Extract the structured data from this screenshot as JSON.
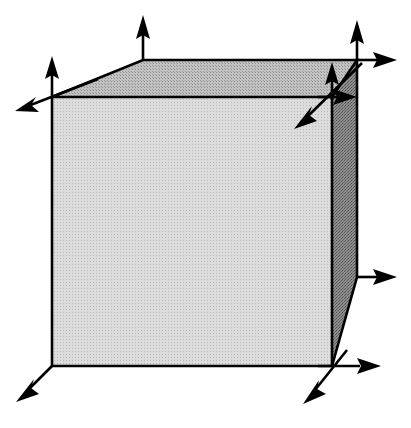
{
  "figure": {
    "type": "line-diagram",
    "canvas": {
      "width": 411,
      "height": 428,
      "background": "#ffffff"
    },
    "colors": {
      "stroke": "#000000",
      "front_face_fill": "#cfcfcf",
      "top_face_fill": "#b3b3b3",
      "right_face_fill": "#7e7e7e",
      "background": "#ffffff"
    },
    "stroke_width": 2.6,
    "cube": {
      "name": "cube",
      "vertices": {
        "front_top_left": [
          52,
          97
        ],
        "front_top_right": [
          332,
          97
        ],
        "front_bottom_left": [
          52,
          366
        ],
        "front_bottom_right": [
          332,
          366
        ],
        "back_top_left": [
          143,
          60
        ],
        "back_top_right": [
          357,
          60
        ],
        "back_bottom_right": [
          357,
          277
        ]
      },
      "faces": [
        {
          "name": "front-face",
          "points": "52,97 332,97 332,366 52,366",
          "fill_key": "front_face_fill"
        },
        {
          "name": "top-face",
          "points": "52,97 143,60 357,60 332,97",
          "fill_key": "top_face_fill"
        },
        {
          "name": "right-face",
          "points": "332,97 357,60 357,277 332,366",
          "fill_key": "right_face_fill"
        }
      ]
    },
    "arrows": [
      {
        "name": "arrow-up-front-top-left",
        "label": "z-axis at front-top-left corner",
        "from": [
          52,
          97
        ],
        "to": [
          52,
          58
        ],
        "head": "end",
        "direction": "up"
      },
      {
        "name": "arrow-diagonal-front-top-left",
        "label": "depth axis at front-top-left corner",
        "from": [
          95,
          80
        ],
        "to": [
          18,
          110
        ],
        "head": "end",
        "direction": "down-left"
      },
      {
        "name": "arrow-up-back-top-left",
        "label": "z-axis at back-top-left corner",
        "from": [
          143,
          60
        ],
        "to": [
          143,
          17
        ],
        "head": "end",
        "direction": "up"
      },
      {
        "name": "arrow-up-back-top-right",
        "label": "z-axis at back-top-right corner",
        "from": [
          357,
          60
        ],
        "to": [
          357,
          22
        ],
        "head": "end",
        "direction": "up"
      },
      {
        "name": "arrow-right-back-top-right",
        "label": "x-axis at back-top-right corner",
        "from": [
          357,
          60
        ],
        "to": [
          396,
          60
        ],
        "head": "end",
        "direction": "right"
      },
      {
        "name": "arrow-up-front-top-right",
        "label": "z-axis at front-top-right corner",
        "from": [
          332,
          97
        ],
        "to": [
          332,
          63
        ],
        "head": "end",
        "direction": "up"
      },
      {
        "name": "arrow-right-front-top-right",
        "label": "x-axis at front-top-right corner",
        "from": [
          332,
          97
        ],
        "to": [
          356,
          97
        ],
        "head": "end",
        "direction": "right"
      },
      {
        "name": "arrow-diagonal-front-top-right",
        "label": "depth axis at front-top-right corner",
        "from": [
          361,
          64
        ],
        "to": [
          296,
          127
        ],
        "head": "end",
        "direction": "down-left"
      },
      {
        "name": "arrow-diagonal-front-bottom-left",
        "label": "depth axis at front-bottom-left corner",
        "from": [
          52,
          366
        ],
        "to": [
          18,
          400
        ],
        "head": "end",
        "direction": "down-left"
      },
      {
        "name": "arrow-right-back-bottom-right",
        "label": "x-axis at back-bottom-right corner",
        "from": [
          357,
          277
        ],
        "to": [
          396,
          277
        ],
        "head": "end",
        "direction": "right"
      },
      {
        "name": "arrow-right-front-bottom-right",
        "label": "x-axis at front-bottom-right corner",
        "from": [
          332,
          366
        ],
        "to": [
          380,
          366
        ],
        "head": "end",
        "direction": "right"
      },
      {
        "name": "arrow-diagonal-front-bottom-right",
        "label": "depth axis at front-bottom-right corner",
        "from": [
          345,
          352
        ],
        "to": [
          305,
          402
        ],
        "head": "end",
        "direction": "down-left"
      }
    ]
  }
}
